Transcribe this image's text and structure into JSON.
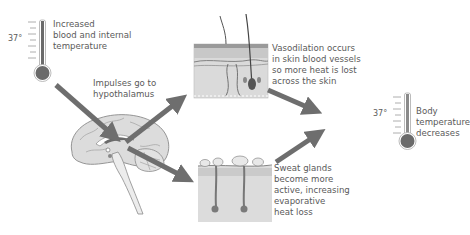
{
  "labels": {
    "increased": "Increased\nblood and internal\ntemperature",
    "impulses": "Impulses go to\nhypothalamus",
    "vasodilation": "Vasodilation occurs\nin skin blood vessels\nso more heat is lost\nacross the skin",
    "sweat": "Sweat glands\nbecome more\nactive, increasing\nevaporative\nheat loss",
    "decreases": "Body\ntemperature\ndecreases"
  },
  "thermometers": {
    "left_mark": "37°",
    "right_mark": "37°"
  },
  "icons": {
    "left_thermometer": "thermometer-high-icon",
    "right_thermometer": "thermometer-normal-icon",
    "brain": "brain-sagittal-icon",
    "skin_vasodilation": "skin-blood-vessels-icon",
    "skin_sweat": "skin-sweat-glands-icon"
  },
  "colors": {
    "arrow": "#6e6e6e",
    "thermo_fill": "#6a6a6a",
    "brain_fill": "#d8d8d8",
    "skin_fill": "#dcdcdc",
    "text": "#5a5a5a"
  }
}
